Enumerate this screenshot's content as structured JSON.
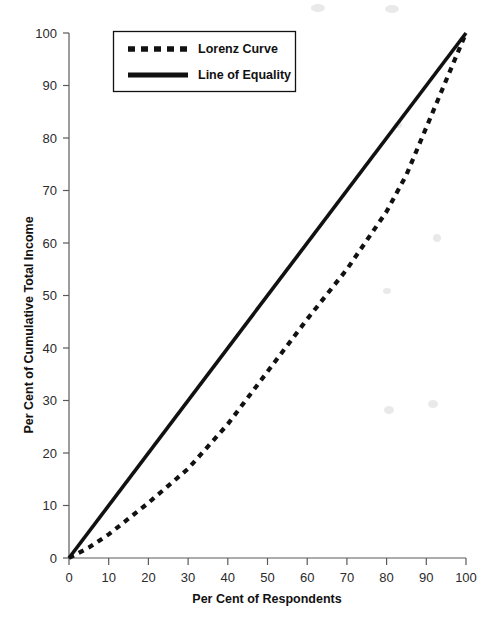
{
  "chart_data": {
    "type": "line",
    "title": "",
    "xlabel": "Per Cent of Respondents",
    "ylabel": "Per Cent of Cumulative Total Income",
    "xlim": [
      0,
      100
    ],
    "ylim": [
      0,
      100
    ],
    "xticks": [
      0,
      10,
      20,
      30,
      40,
      50,
      60,
      70,
      80,
      90,
      100
    ],
    "yticks": [
      0,
      10,
      20,
      30,
      40,
      50,
      60,
      70,
      80,
      90,
      100
    ],
    "grid": false,
    "legend_position": "upper-left",
    "series": [
      {
        "name": "Lorenz Curve",
        "style": "dashed",
        "color": "#111111",
        "x": [
          0,
          5,
          10,
          20,
          30,
          40,
          50,
          60,
          70,
          80,
          85,
          90,
          95,
          100
        ],
        "values": [
          0,
          2,
          4.5,
          10.5,
          17,
          25.5,
          35.5,
          45.5,
          55,
          66,
          73,
          82,
          91,
          100
        ]
      },
      {
        "name": "Line of Equality",
        "style": "solid",
        "color": "#111111",
        "x": [
          0,
          100
        ],
        "values": [
          0,
          100
        ]
      }
    ]
  },
  "legend": {
    "items": [
      {
        "label": "Lorenz Curve",
        "style": "dashed"
      },
      {
        "label": "Line of Equality",
        "style": "solid"
      }
    ]
  },
  "axes": {
    "x_title": "Per Cent of Respondents",
    "y_title": "Per Cent of Cumulative Total Income",
    "x_tick_labels": [
      "0",
      "10",
      "20",
      "30",
      "40",
      "50",
      "60",
      "70",
      "80",
      "90",
      "100"
    ],
    "y_tick_labels": [
      "0",
      "10",
      "20",
      "30",
      "40",
      "50",
      "60",
      "70",
      "80",
      "90",
      "100"
    ]
  },
  "colors": {
    "ink": "#111111",
    "axis": "#5a5a5a",
    "background": "#ffffff"
  }
}
